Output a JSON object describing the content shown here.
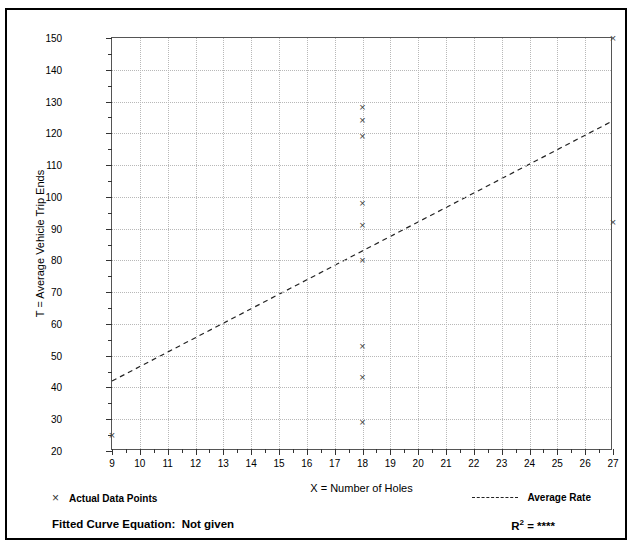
{
  "chart_data": {
    "type": "scatter",
    "title": "",
    "xlabel": "X = Number of Holes",
    "ylabel": "T = Average Vehicle Trip Ends",
    "xlim": [
      9,
      27
    ],
    "ylim": [
      20,
      150
    ],
    "x_ticks": [
      9,
      10,
      11,
      12,
      13,
      14,
      15,
      16,
      17,
      18,
      19,
      20,
      21,
      22,
      23,
      24,
      25,
      26,
      27
    ],
    "y_ticks": [
      20,
      30,
      40,
      50,
      60,
      70,
      80,
      90,
      100,
      110,
      120,
      130,
      140,
      150
    ],
    "x_minor_step": 0.5,
    "y_minor_step": 5,
    "grid": true,
    "legend_position": "below-plot",
    "series": [
      {
        "name": "Actual Data Points",
        "type": "scatter",
        "marker": "x",
        "color": "#444444",
        "points": [
          {
            "x": 9,
            "y": 25
          },
          {
            "x": 18,
            "y": 128
          },
          {
            "x": 18,
            "y": 124
          },
          {
            "x": 18,
            "y": 119
          },
          {
            "x": 18,
            "y": 98
          },
          {
            "x": 18,
            "y": 91
          },
          {
            "x": 18,
            "y": 80
          },
          {
            "x": 18,
            "y": 53
          },
          {
            "x": 18,
            "y": 43
          },
          {
            "x": 18,
            "y": 29
          },
          {
            "x": 27,
            "y": 150
          },
          {
            "x": 27,
            "y": 92
          }
        ]
      },
      {
        "name": "Average Rate",
        "type": "line",
        "style": "dashed",
        "color": "#222222",
        "points": [
          {
            "x": 9,
            "y": 41.5
          },
          {
            "x": 27,
            "y": 123.5
          }
        ]
      }
    ]
  },
  "legend": {
    "actual_data_points_label": "Actual Data Points",
    "actual_data_points_marker": "×",
    "average_rate_label": "Average Rate",
    "average_rate_marker": "dashed-line"
  },
  "footer": {
    "fitted_curve_equation": "Fitted Curve Equation:  Not given",
    "r_squared_label": "R",
    "r_squared_exponent": "2",
    "r_squared_value": "= ****"
  }
}
